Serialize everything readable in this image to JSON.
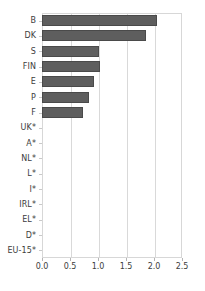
{
  "chart_data": {
    "type": "bar",
    "orientation": "horizontal",
    "title": "",
    "subtitle": "",
    "xlabel": "",
    "ylabel": "",
    "xlim": [
      0.0,
      2.5
    ],
    "xticks": [
      "0.0",
      "0.5",
      "1.0",
      "1.5",
      "2.0",
      "2.5"
    ],
    "xtick_values": [
      0.0,
      0.5,
      1.0,
      1.5,
      2.0,
      2.5
    ],
    "grid": "vertical",
    "legend": "none",
    "bar_color": "#5e5e5e",
    "gridline_color": "#d9d9d9",
    "axis_color": "#d7d7d7",
    "background": "#ffffff",
    "categories": [
      "B",
      "DK",
      "S",
      "FIN",
      "E",
      "P",
      "F",
      "UK*",
      "A*",
      "NL*",
      "L*",
      "I*",
      "IRL*",
      "EL*",
      "D*",
      "EU-15*"
    ],
    "values": [
      2.05,
      1.86,
      1.02,
      1.03,
      0.93,
      0.84,
      0.73,
      0,
      0,
      0,
      0,
      0,
      0,
      0,
      0,
      0
    ],
    "note": "Categories marked with * have no bar displayed"
  }
}
